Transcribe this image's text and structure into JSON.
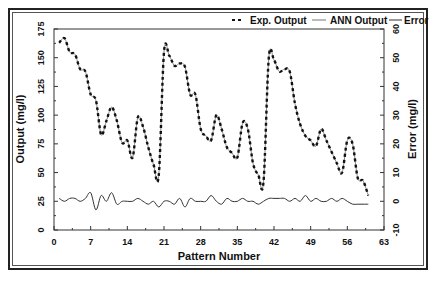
{
  "chart_data": {
    "type": "line",
    "title": "",
    "xlabel": "Pattern Number",
    "ylabel": "Output (mg/l)",
    "ylabel_right": "Error (mg/l)",
    "xlim": [
      0,
      63
    ],
    "ylim": [
      0,
      175
    ],
    "ylim_right": [
      -10,
      60
    ],
    "xticks": [
      0,
      7,
      14,
      21,
      28,
      35,
      42,
      49,
      56,
      63
    ],
    "yticks": [
      0,
      25,
      50,
      75,
      100,
      125,
      150,
      175
    ],
    "yticks_right": [
      -10,
      0,
      10,
      20,
      30,
      40,
      50,
      60
    ],
    "grid": false,
    "legend_position": "top-right inside",
    "legend": [
      "Exp. Output",
      "ANN Output",
      "Error"
    ],
    "x": [
      1,
      2,
      3,
      4,
      5,
      6,
      7,
      8,
      9,
      10,
      11,
      12,
      13,
      14,
      15,
      16,
      17,
      18,
      19,
      20,
      21,
      22,
      23,
      24,
      25,
      26,
      27,
      28,
      29,
      30,
      31,
      32,
      33,
      34,
      35,
      36,
      37,
      38,
      39,
      40,
      41,
      42,
      43,
      44,
      45,
      46,
      47,
      48,
      49,
      50,
      51,
      52,
      53,
      54,
      55,
      56,
      57,
      58,
      59,
      60
    ],
    "series": [
      {
        "name": "Exp. Output",
        "axis": "left",
        "style": "dashed",
        "values": [
          163,
          167,
          155,
          153,
          140,
          138,
          118,
          113,
          83,
          95,
          107,
          95,
          76,
          78,
          63,
          98,
          90,
          72,
          57,
          48,
          155,
          152,
          143,
          145,
          142,
          118,
          118,
          88,
          82,
          78,
          100,
          88,
          72,
          67,
          63,
          93,
          88,
          58,
          48,
          42,
          150,
          148,
          138,
          140,
          138,
          110,
          92,
          82,
          78,
          73,
          88,
          78,
          68,
          58,
          50,
          78,
          75,
          45,
          43,
          30
        ]
      },
      {
        "name": "ANN Output",
        "axis": "left",
        "style": "solid",
        "values": [
          163,
          167,
          155,
          153,
          140,
          138,
          118,
          113,
          83,
          95,
          107,
          95,
          76,
          78,
          63,
          98,
          90,
          72,
          57,
          48,
          155,
          152,
          143,
          145,
          142,
          118,
          118,
          88,
          82,
          78,
          100,
          88,
          72,
          67,
          63,
          93,
          88,
          58,
          48,
          42,
          150,
          148,
          138,
          140,
          138,
          110,
          92,
          82,
          78,
          73,
          88,
          78,
          68,
          58,
          50,
          78,
          75,
          45,
          43,
          30
        ]
      },
      {
        "name": "Error",
        "axis": "right",
        "style": "solid",
        "values": [
          1,
          0,
          1,
          1,
          0,
          1,
          3,
          -3,
          2,
          0,
          3,
          -1,
          0,
          0,
          0,
          1,
          0,
          -1,
          0,
          -2,
          0,
          0,
          -1,
          1,
          -2,
          1,
          0,
          0,
          0,
          2,
          0,
          -1,
          1,
          0,
          0,
          1,
          0,
          0,
          -1,
          0,
          1,
          1,
          1,
          1,
          0,
          1,
          0,
          2,
          0,
          1,
          0,
          0,
          1,
          0,
          1,
          0,
          -1,
          -1,
          -1,
          -1
        ]
      }
    ]
  }
}
